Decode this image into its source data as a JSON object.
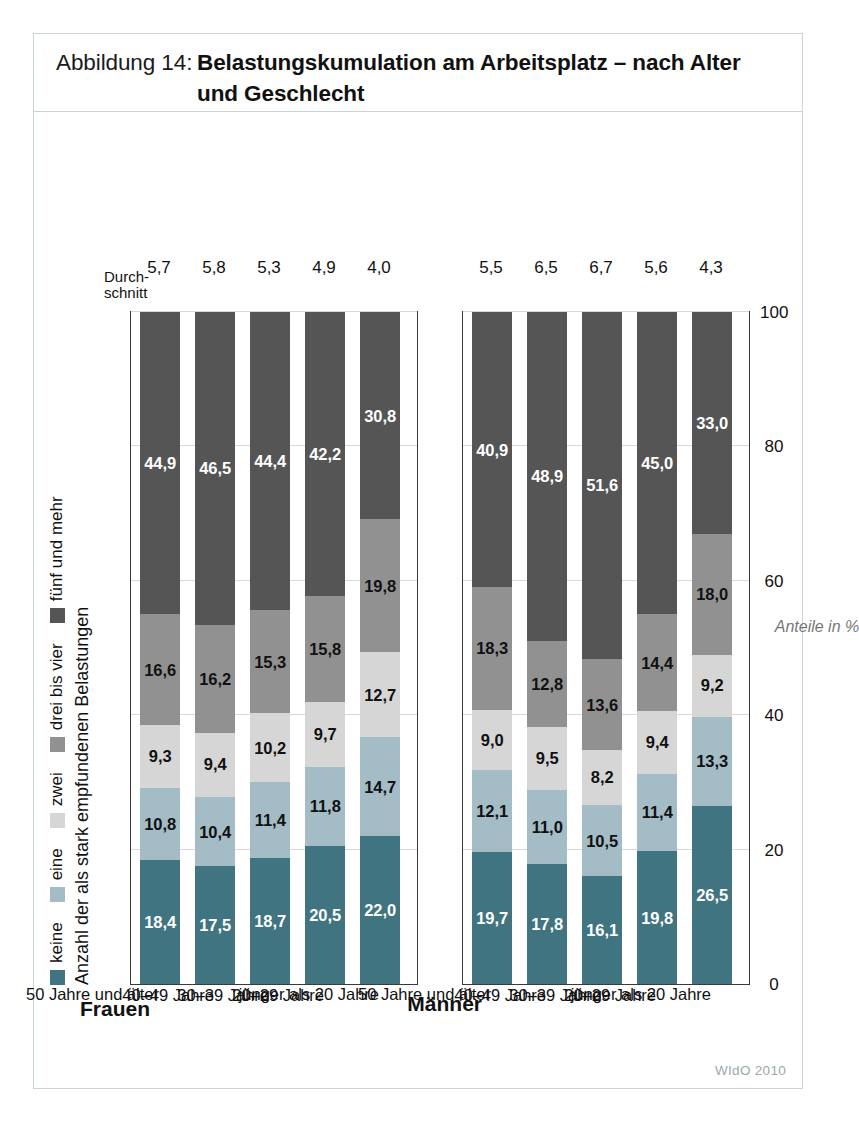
{
  "figure": {
    "number_label": "Abbildung 14:",
    "title_line1": "Belastungskumulation am Arbeitsplatz – nach Alter",
    "title_line2": "und Geschlecht",
    "source": "WIdO 2010",
    "frame_color": "#c9d6d9"
  },
  "legend": {
    "title": "Anzahl der als stark empfundenen Belastungen",
    "items": [
      {
        "label": "keine",
        "color": "#3f7480"
      },
      {
        "label": "eine",
        "color": "#a3bcc6"
      },
      {
        "label": "zwei",
        "color": "#d6d6d6"
      },
      {
        "label": "drei bis vier",
        "color": "#919191"
      },
      {
        "label": "fünf und mehr",
        "color": "#555555"
      }
    ]
  },
  "axis": {
    "title": "Anteile in %",
    "ticks": [
      "0",
      "20",
      "40",
      "60",
      "80",
      "100"
    ],
    "min": 0,
    "max": 100
  },
  "average_header": {
    "line1": "Durch-",
    "line2": "schnitt"
  },
  "groups": [
    {
      "name": "Frauen",
      "rows": [
        {
          "category": "50 Jahre und älter",
          "values": [
            18.4,
            10.8,
            9.3,
            16.6,
            44.9
          ],
          "labels": [
            "18,4",
            "10,8",
            "9,3",
            "16,6",
            "44,9"
          ],
          "average": "5,7"
        },
        {
          "category": "40–49 Jahre",
          "values": [
            17.5,
            10.4,
            9.4,
            16.2,
            46.5
          ],
          "labels": [
            "17,5",
            "10,4",
            "9,4",
            "16,2",
            "46,5"
          ],
          "average": "5,8"
        },
        {
          "category": "30–39 Jahre",
          "values": [
            18.7,
            11.4,
            10.2,
            15.3,
            44.4
          ],
          "labels": [
            "18,7",
            "11,4",
            "10,2",
            "15,3",
            "44,4"
          ],
          "average": "5,3"
        },
        {
          "category": "20–29 Jahre",
          "values": [
            20.5,
            11.8,
            9.7,
            15.8,
            42.2
          ],
          "labels": [
            "20,5",
            "11,8",
            "9,7",
            "15,8",
            "42,2"
          ],
          "average": "4,9"
        },
        {
          "category": "jünger als 20 Jahre",
          "values": [
            22.0,
            14.7,
            12.7,
            19.8,
            30.8
          ],
          "labels": [
            "22,0",
            "14,7",
            "12,7",
            "19,8",
            "30,8"
          ],
          "average": "4,0"
        }
      ]
    },
    {
      "name": "Männer",
      "rows": [
        {
          "category": "50 Jahre und älter",
          "values": [
            19.7,
            12.1,
            9.0,
            18.3,
            40.9
          ],
          "labels": [
            "19,7",
            "12,1",
            "9,0",
            "18,3",
            "40,9"
          ],
          "average": "5,5"
        },
        {
          "category": "40–49 Jahre",
          "values": [
            17.8,
            11.0,
            9.5,
            12.8,
            48.9
          ],
          "labels": [
            "17,8",
            "11,0",
            "9,5",
            "12,8",
            "48,9"
          ],
          "average": "6,5"
        },
        {
          "category": "30–39 Jahre",
          "values": [
            16.1,
            10.5,
            8.2,
            13.6,
            51.6
          ],
          "labels": [
            "16,1",
            "10,5",
            "8,2",
            "13,6",
            "51,6"
          ],
          "average": "6,7"
        },
        {
          "category": "20–29 Jahre",
          "values": [
            19.8,
            11.4,
            9.4,
            14.4,
            45.0
          ],
          "labels": [
            "19,8",
            "11,4",
            "9,4",
            "14,4",
            "45,0"
          ],
          "average": "5,6"
        },
        {
          "category": "jünger als 20 Jahre",
          "values": [
            26.5,
            13.3,
            9.2,
            18.0,
            33.0
          ],
          "labels": [
            "26,5",
            "13,3",
            "9,2",
            "18,0",
            "33,0"
          ],
          "average": "4,3"
        }
      ]
    }
  ],
  "chart_data": {
    "type": "bar",
    "orientation": "horizontal-stacked",
    "title": "Abbildung 14: Belastungskumulation am Arbeitsplatz – nach Alter und Geschlecht",
    "xlabel": "Anteile in %",
    "ylabel": "",
    "xlim": [
      0,
      100
    ],
    "xticks": [
      0,
      20,
      40,
      60,
      80,
      100
    ],
    "grid": true,
    "legend_position": "top",
    "stacked": true,
    "panels": [
      {
        "name": "Frauen",
        "categories": [
          "50 Jahre und älter",
          "40–49 Jahre",
          "30–39 Jahre",
          "20–29 Jahre",
          "jünger als 20 Jahre"
        ],
        "series": [
          {
            "name": "keine",
            "values": [
              18.4,
              17.5,
              18.7,
              20.5,
              22.0
            ]
          },
          {
            "name": "eine",
            "values": [
              10.8,
              10.4,
              11.4,
              11.8,
              14.7
            ]
          },
          {
            "name": "zwei",
            "values": [
              9.3,
              9.4,
              10.2,
              9.7,
              12.7
            ]
          },
          {
            "name": "drei bis vier",
            "values": [
              16.6,
              16.2,
              15.3,
              15.8,
              19.8
            ]
          },
          {
            "name": "fünf und mehr",
            "values": [
              44.9,
              46.5,
              44.4,
              42.2,
              30.8
            ]
          }
        ],
        "annotations": {
          "Durchschnitt": [
            5.7,
            5.8,
            5.3,
            4.9,
            4.0
          ]
        }
      },
      {
        "name": "Männer",
        "categories": [
          "50 Jahre und älter",
          "40–49 Jahre",
          "30–39 Jahre",
          "20–29 Jahre",
          "jünger als 20 Jahre"
        ],
        "series": [
          {
            "name": "keine",
            "values": [
              19.7,
              17.8,
              16.1,
              19.8,
              26.5
            ]
          },
          {
            "name": "eine",
            "values": [
              12.1,
              11.0,
              10.5,
              11.4,
              13.3
            ]
          },
          {
            "name": "zwei",
            "values": [
              9.0,
              9.5,
              8.2,
              9.4,
              9.2
            ]
          },
          {
            "name": "drei bis vier",
            "values": [
              18.3,
              12.8,
              13.6,
              14.4,
              18.0
            ]
          },
          {
            "name": "fünf und mehr",
            "values": [
              40.9,
              48.9,
              51.6,
              45.0,
              33.0
            ]
          }
        ],
        "annotations": {
          "Durchschnitt": [
            5.5,
            6.5,
            6.7,
            5.6,
            4.3
          ]
        }
      }
    ]
  }
}
